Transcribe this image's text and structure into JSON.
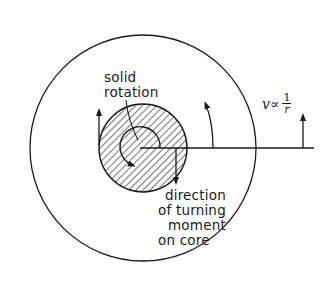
{
  "diagram": {
    "type": "physics-vortex-core",
    "labels": {
      "solid_rotation": {
        "line1": "solid",
        "line2": "rotation"
      },
      "velocity_relation": {
        "prefix": "v∝",
        "numerator": "1",
        "denominator": "r"
      },
      "turning_moment": {
        "line1": "direction",
        "line2": "of turning",
        "line3": "moment",
        "line4": "on core"
      }
    },
    "colors": {
      "stroke": "#1a1a1a",
      "background": "#ffffff",
      "hatch": "#2a2a2a"
    },
    "geometry": {
      "outer_circle": {
        "cx": 143,
        "cy": 148,
        "r": 113
      },
      "core_circle": {
        "cx": 143,
        "cy": 148,
        "r": 44
      },
      "radial_line": {
        "x1": 140,
        "y1": 148,
        "x2": 314,
        "y2": 148
      }
    }
  }
}
